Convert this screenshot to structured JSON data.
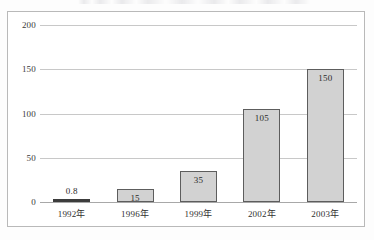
{
  "figure": {
    "background_color": "#ffffff",
    "frame_color": "#b9b9b9",
    "bar_fill_color": "#d2d2d2",
    "bar_border_color": "#5d5d5d",
    "gridline_color": "#c8c8c8"
  },
  "chart_data": {
    "type": "bar",
    "title": "",
    "xlabel": "",
    "ylabel": "",
    "categories": [
      "1992年",
      "1996年",
      "1999年",
      "2002年",
      "2003年"
    ],
    "values": [
      0.8,
      15,
      35,
      105,
      150
    ],
    "value_labels": [
      "0.8",
      "15",
      "35",
      "105",
      "150"
    ],
    "ylim": [
      0,
      200
    ],
    "yticks": [
      0,
      50,
      100,
      150,
      200
    ],
    "ytick_labels": [
      "0",
      "50",
      "100",
      "150",
      "200"
    ],
    "grid": true,
    "legend": false,
    "legend_position": "none"
  }
}
